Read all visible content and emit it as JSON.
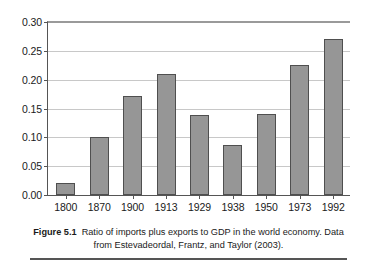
{
  "chart_data": {
    "type": "bar",
    "title": "",
    "xlabel": "",
    "ylabel": "",
    "categories": [
      "1800",
      "1870",
      "1900",
      "1913",
      "1929",
      "1938",
      "1950",
      "1973",
      "1992"
    ],
    "values": [
      0.021,
      0.1,
      0.172,
      0.209,
      0.139,
      0.086,
      0.141,
      0.225,
      0.27
    ],
    "ylim": [
      0.0,
      0.3
    ],
    "yticks": [
      "0.00",
      "0.05",
      "0.10",
      "0.15",
      "0.20",
      "0.25",
      "0.30"
    ],
    "ytick_values": [
      0.0,
      0.05,
      0.1,
      0.15,
      0.2,
      0.25,
      0.3
    ],
    "grid": true,
    "legend": "none",
    "bar_color": "#969696",
    "bar_border_color": "#4f4f4f",
    "gridline_color": "#c8c8c8",
    "axis_color": "#555555"
  },
  "caption": {
    "label": "Figure 5.1",
    "text": "Ratio of imports plus exports to GDP in the world economy. Data from Estevadeordal, Frantz, and Taylor (2003)."
  }
}
